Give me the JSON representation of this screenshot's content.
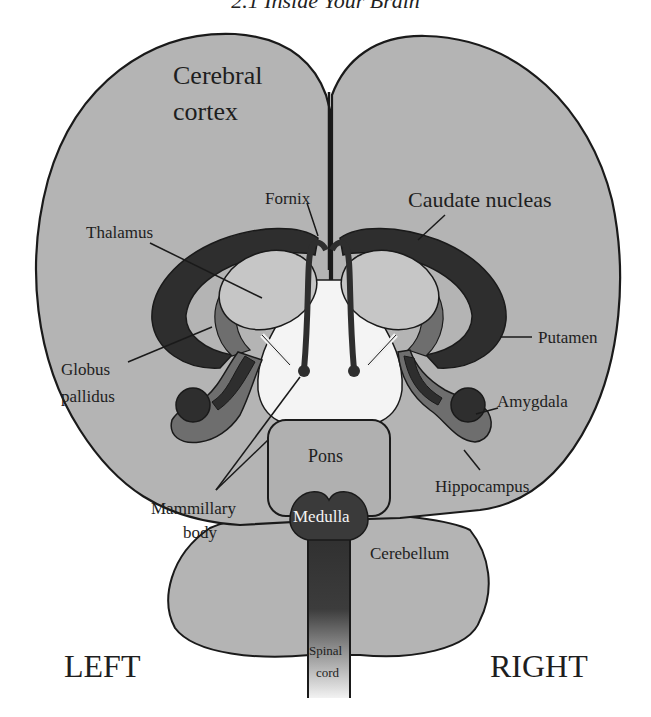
{
  "header": {
    "title": "2.1 Inside Your Brain"
  },
  "colors": {
    "cortex_fill": "#b4b4b4",
    "outline": "#1a1a1a",
    "dark_structure": "#2e2e2e",
    "mid_structure": "#6e6e6e",
    "thalamus_fill": "#c6c6c6",
    "ventricle_fill": "#f4f4f4",
    "brainstem_fill": "#b0b0b0",
    "medulla_fill": "#3a3a3a",
    "background": "#ffffff"
  },
  "labels": {
    "cerebral_cortex_1": "Cerebral",
    "cerebral_cortex_2": "cortex",
    "fornix": "Fornix",
    "caudate_nucleus": "Caudate nucleas",
    "thalamus": "Thalamus",
    "putamen": "Putamen",
    "globus_pallidus_1": "Globus",
    "globus_pallidus_2": "pallidus",
    "amygdala": "Amygdala",
    "pons": "Pons",
    "hippocampus": "Hippocampus",
    "mammillary_body_1": "Mammillary",
    "mammillary_body_2": "body",
    "medulla": "Medulla",
    "cerebellum": "Cerebellum",
    "spinal_cord_1": "Spinal",
    "spinal_cord_2": "cord",
    "left": "LEFT",
    "right": "RIGHT"
  }
}
